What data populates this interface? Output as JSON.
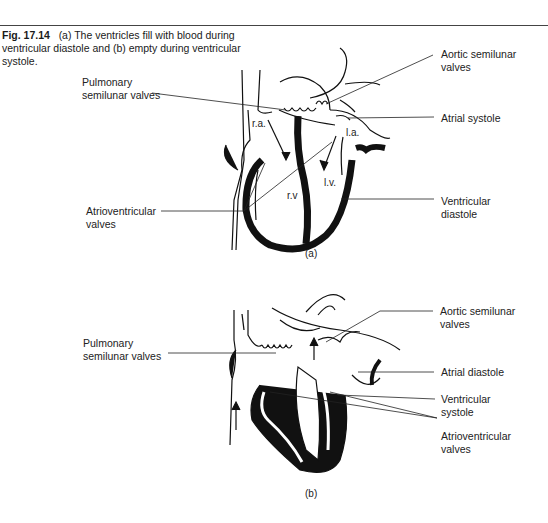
{
  "caption": {
    "figure_number": "Fig. 17.14",
    "text": "(a) The ventricles fill with blood during ventricular diastole and (b) empty during ventricular systole."
  },
  "panel_a": {
    "sublabel": "(a)",
    "chambers": {
      "right_atrium": "r.a.",
      "left_atrium": "l.a.",
      "right_ventricle": "r.v",
      "left_ventricle": "l.v."
    },
    "labels": {
      "pulmonary_line1": "Pulmonary",
      "pulmonary_line2": "semilunar valves",
      "av_line1": "Atrioventricular",
      "av_line2": "valves",
      "aortic_line1": "Aortic semilunar",
      "aortic_line2": "valves",
      "atrial": "Atrial systole",
      "ventricular_line1": "Ventricular",
      "ventricular_line2": "diastole"
    }
  },
  "panel_b": {
    "sublabel": "(b)",
    "labels": {
      "pulmonary_line1": "Pulmonary",
      "pulmonary_line2": "semilunar valves",
      "aortic_line1": "Aortic semilunar",
      "aortic_line2": "valves",
      "atrial": "Atrial diastole",
      "ventricular_line1": "Ventricular",
      "ventricular_line2": "systole",
      "av_line1": "Atrioventricular",
      "av_line2": "valves"
    }
  }
}
